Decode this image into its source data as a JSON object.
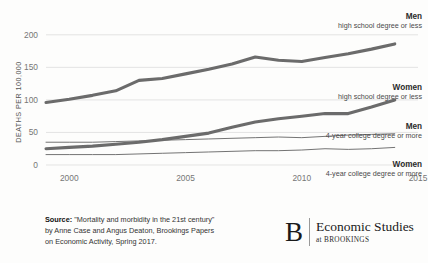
{
  "chart_data": {
    "type": "line",
    "title": "",
    "xlabel": "",
    "ylabel": "DEATHS PER 100,000",
    "xlim": [
      1999,
      2015
    ],
    "ylim": [
      0,
      212
    ],
    "grid": "horizontal",
    "legend_position": "inline-right-annotations",
    "x_ticks": [
      "2000",
      "2005",
      "2010",
      "2015"
    ],
    "x_tick_values": [
      2000,
      2005,
      2010,
      2015
    ],
    "y_ticks": [
      "0",
      "50",
      "100",
      "150",
      "200"
    ],
    "y_tick_values": [
      0,
      50,
      100,
      150,
      200
    ],
    "x": [
      1999,
      2000,
      2001,
      2002,
      2003,
      2004,
      2005,
      2006,
      2007,
      2008,
      2009,
      2010,
      2011,
      2012,
      2013,
      2014
    ],
    "series": [
      {
        "name": "Men, high school degree or less",
        "label_title": "Men",
        "label_sub": "high school degree or less",
        "color": "#6b6b6b",
        "width": "thick",
        "values": [
          96,
          101,
          107,
          114,
          130,
          133,
          140,
          147,
          155,
          166,
          161,
          159,
          165,
          171,
          178,
          186
        ]
      },
      {
        "name": "Women, high school degree or less",
        "label_title": "Women",
        "label_sub": "high school degree or less",
        "color": "#6b6b6b",
        "width": "thick",
        "values": [
          25,
          27,
          29,
          32,
          35,
          39,
          44,
          49,
          58,
          66,
          71,
          75,
          79,
          79,
          89,
          100
        ]
      },
      {
        "name": "Men, 4-year college degree or more",
        "label_title": "Men",
        "label_sub": "4-year college degree or more",
        "color": "#6b6b6b",
        "width": "thin",
        "values": [
          35,
          35,
          35,
          36,
          37,
          38,
          39,
          40,
          41,
          42,
          43,
          42,
          44,
          46,
          47,
          48
        ]
      },
      {
        "name": "Women, 4-year college degree or more",
        "label_title": "Women",
        "label_sub": "4-year college degree or more",
        "color": "#6b6b6b",
        "width": "thin",
        "values": [
          16,
          16,
          16,
          16,
          17,
          18,
          19,
          20,
          21,
          22,
          22,
          23,
          25,
          24,
          25,
          27
        ]
      }
    ]
  },
  "annotations": {
    "men_hs": {
      "title": "Men",
      "sub": "high school degree or less"
    },
    "women_hs": {
      "title": "Women",
      "sub": "high school degree or less"
    },
    "men_col": {
      "title": "Men",
      "sub": "4-year college degree or more"
    },
    "women_col": {
      "title": "Women",
      "sub": "4-year college degree or more"
    }
  },
  "source": {
    "prefix": "Source:",
    "line1": " \"Mortality and morbidity in the 21st century\"",
    "line2": "by Anne Case and Angus Deaton, Brookings Papers",
    "line3": "on Economic Activity, Spring 2017."
  },
  "logo": {
    "mark": "B",
    "main": "Economic Studies",
    "sub": "at BROOKINGS"
  }
}
